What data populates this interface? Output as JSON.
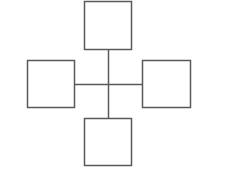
{
  "diagram": {
    "type": "cross-of-boxes",
    "stroke_color": "#5a5a5a",
    "background": "#ffffff",
    "center": {
      "x": 108,
      "y": 84
    },
    "boxes": [
      {
        "id": "top",
        "x": 84,
        "y": 1,
        "w": 47,
        "h": 48
      },
      {
        "id": "left",
        "x": 27,
        "y": 60,
        "w": 47,
        "h": 47
      },
      {
        "id": "right",
        "x": 142,
        "y": 60,
        "w": 48,
        "h": 47
      },
      {
        "id": "bottom",
        "x": 84,
        "y": 118,
        "w": 47,
        "h": 47
      }
    ],
    "connectors": [
      {
        "id": "vertical",
        "x1": 108,
        "y1": 49,
        "x2": 108,
        "y2": 118
      },
      {
        "id": "horizontal",
        "x1": 74,
        "y1": 84,
        "x2": 142,
        "y2": 84
      }
    ]
  }
}
